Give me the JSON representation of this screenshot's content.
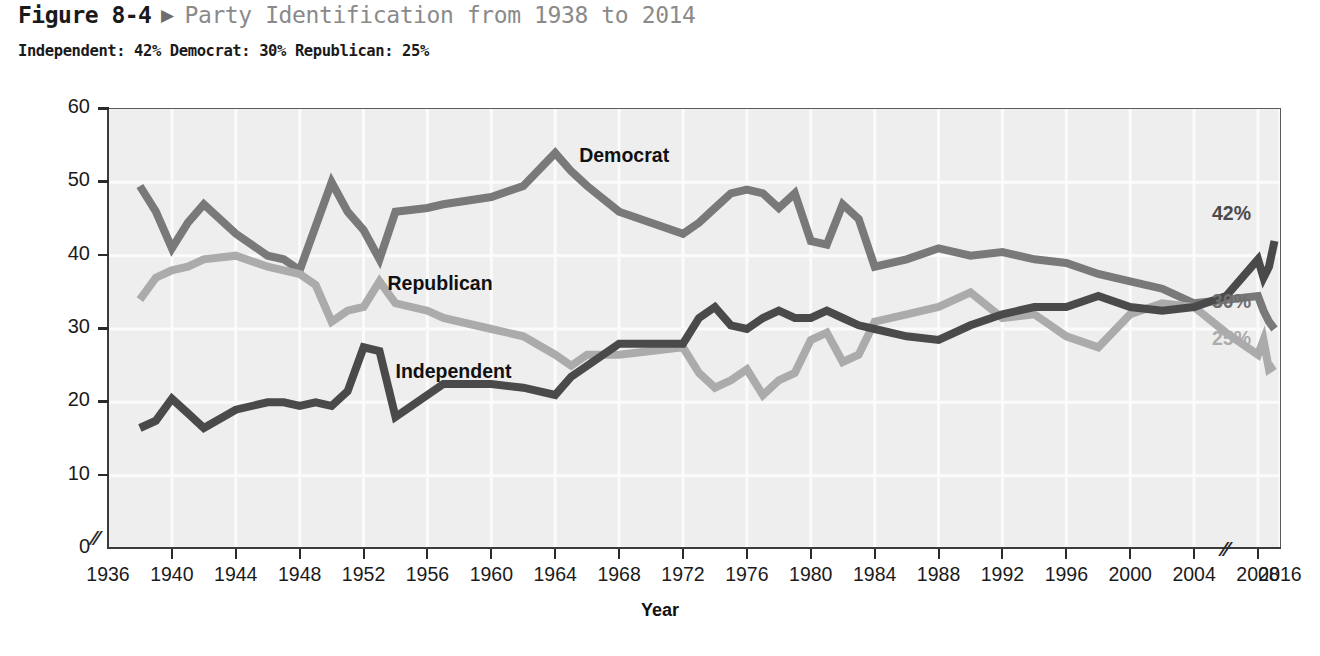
{
  "header": {
    "figure_number": "Figure 8-4",
    "arrow": "▶",
    "title": "Party Identification from 1938 to 2014",
    "subtitle": "Independent: 42% Democrat: 30% Republican: 25%"
  },
  "chart_data": {
    "type": "line",
    "title": "Party Identification from 1938 to 2014",
    "xlabel": "Year",
    "ylabel": "Percentage",
    "xlim": [
      1936,
      2016
    ],
    "ylim": [
      0,
      60
    ],
    "ytick_labels": [
      "0",
      "10",
      "20",
      "30",
      "40",
      "50",
      "60"
    ],
    "yticks": [
      0,
      10,
      20,
      30,
      40,
      50,
      60
    ],
    "xticks": [
      1936,
      1940,
      1944,
      1948,
      1952,
      1956,
      1960,
      1964,
      1968,
      1972,
      1976,
      1980,
      1984,
      1988,
      1992,
      1996,
      2000,
      2004,
      2008,
      2016
    ],
    "xtick_labels": [
      "1936",
      "1940",
      "1944",
      "1948",
      "1952",
      "1956",
      "1960",
      "1964",
      "1968",
      "1972",
      "1976",
      "1980",
      "1984",
      "1988",
      "1992",
      "1996",
      "2000",
      "2004",
      "2008",
      "2016"
    ],
    "grid": true,
    "axis_break_y": true,
    "axis_break_x": true,
    "legend_position": "inline-labels",
    "series": [
      {
        "name": "Democrat",
        "color": "#797979",
        "label_x": 1965.5,
        "label_y": 53.5,
        "end_label": "30%",
        "x": [
          1938,
          1939,
          1940,
          1941,
          1942,
          1944,
          1946,
          1947,
          1948,
          1949,
          1950,
          1951,
          1952,
          1953,
          1954,
          1956,
          1957,
          1960,
          1962,
          1964,
          1965,
          1966,
          1968,
          1970,
          1972,
          1973,
          1974,
          1975,
          1976,
          1977,
          1978,
          1979,
          1980,
          1981,
          1982,
          1983,
          1984,
          1986,
          1988,
          1990,
          1992,
          1994,
          1996,
          1998,
          2000,
          2002,
          2004,
          2006,
          2008,
          2010,
          2012,
          2014
        ],
        "y": [
          49.5,
          46.0,
          41.0,
          44.5,
          47.0,
          43.0,
          40.0,
          39.5,
          38.0,
          44.0,
          50.0,
          46.0,
          43.5,
          39.5,
          46.0,
          46.5,
          47.0,
          48.0,
          49.5,
          54.0,
          51.5,
          49.5,
          46.0,
          44.5,
          43.0,
          44.5,
          46.5,
          48.5,
          49.0,
          48.5,
          46.5,
          48.5,
          42.0,
          41.5,
          47.0,
          45.0,
          38.5,
          39.5,
          41.0,
          40.0,
          40.5,
          39.5,
          39.0,
          37.5,
          36.5,
          35.5,
          33.5,
          34.0,
          34.5,
          32.5,
          31.0,
          30.0
        ]
      },
      {
        "name": "Republican",
        "color": "#ababab",
        "label_x": 1953.5,
        "label_y": 36.0,
        "end_label": "25%",
        "x": [
          1938,
          1939,
          1940,
          1941,
          1942,
          1944,
          1946,
          1947,
          1948,
          1949,
          1950,
          1951,
          1952,
          1953,
          1954,
          1956,
          1957,
          1960,
          1962,
          1964,
          1965,
          1966,
          1968,
          1970,
          1972,
          1973,
          1974,
          1975,
          1976,
          1977,
          1978,
          1979,
          1980,
          1981,
          1982,
          1983,
          1984,
          1986,
          1988,
          1990,
          1992,
          1994,
          1996,
          1998,
          2000,
          2002,
          2004,
          2006,
          2008,
          2010,
          2012,
          2014
        ],
        "y": [
          34.0,
          37.0,
          38.0,
          38.5,
          39.5,
          40.0,
          38.5,
          38.0,
          37.5,
          36.0,
          31.0,
          32.5,
          33.0,
          36.5,
          33.5,
          32.5,
          31.5,
          30.0,
          29.0,
          26.5,
          25.0,
          26.5,
          26.5,
          27.0,
          27.5,
          24.0,
          22.0,
          23.0,
          24.5,
          21.0,
          23.0,
          24.0,
          28.5,
          29.5,
          25.5,
          26.5,
          31.0,
          32.0,
          33.0,
          35.0,
          31.5,
          32.0,
          29.0,
          27.5,
          32.0,
          33.5,
          33.0,
          29.5,
          26.5,
          28.5,
          24.5,
          25.0
        ]
      },
      {
        "name": "Independent",
        "color": "#4a4a4a",
        "label_x": 1954.0,
        "label_y": 24.0,
        "end_label": "42%",
        "x": [
          1938,
          1939,
          1940,
          1941,
          1942,
          1944,
          1946,
          1947,
          1948,
          1949,
          1950,
          1951,
          1952,
          1953,
          1954,
          1956,
          1957,
          1960,
          1962,
          1964,
          1965,
          1966,
          1968,
          1970,
          1972,
          1973,
          1974,
          1975,
          1976,
          1977,
          1978,
          1979,
          1980,
          1981,
          1982,
          1983,
          1984,
          1986,
          1988,
          1990,
          1992,
          1994,
          1996,
          1998,
          2000,
          2002,
          2004,
          2006,
          2008,
          2010,
          2012,
          2014
        ],
        "y": [
          16.5,
          17.5,
          20.5,
          18.5,
          16.5,
          19.0,
          20.0,
          20.0,
          19.5,
          20.0,
          19.5,
          21.5,
          27.5,
          27.0,
          18.0,
          21.0,
          22.5,
          22.5,
          22.0,
          21.0,
          23.5,
          25.0,
          28.0,
          28.0,
          28.0,
          31.5,
          33.0,
          30.5,
          30.0,
          31.5,
          32.5,
          31.5,
          31.5,
          32.5,
          31.5,
          30.5,
          30.0,
          29.0,
          28.5,
          30.5,
          32.0,
          33.0,
          33.0,
          34.5,
          33.0,
          32.5,
          33.0,
          34.5,
          39.5,
          37.0,
          38.5,
          42.0
        ]
      }
    ]
  }
}
